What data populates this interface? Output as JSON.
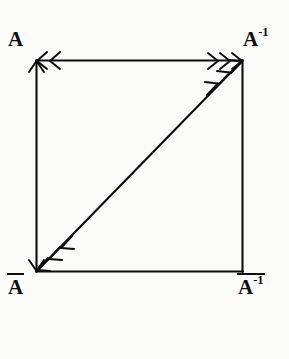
{
  "figure": {
    "background_color": "#fbfbf9",
    "ink_color": "#0d0d0d"
  },
  "vertices": {
    "top_left": {
      "base": "A",
      "overline": false,
      "superscript": ""
    },
    "top_right": {
      "base": "A",
      "overline": false,
      "superscript": "-1"
    },
    "bottom_left": {
      "base": "A",
      "overline": true,
      "superscript": ""
    },
    "bottom_right": {
      "base": "A",
      "overline": true,
      "superscript": "-1"
    }
  },
  "edges": {
    "top": {
      "name": "top-edge",
      "arrow_left_count": 2,
      "arrow_right_count": 3,
      "double_headed": true
    },
    "left": {
      "name": "left-edge",
      "arrow_up_count": 1,
      "arrow_down_count": 1,
      "double_headed": true
    },
    "right": {
      "name": "right-edge",
      "arrow_up_count": 0,
      "arrow_down_count": 0,
      "double_headed": false
    },
    "bottom": {
      "name": "bottom-edge",
      "arrow_left_count": 0,
      "arrow_right_count": 0,
      "double_headed": false
    },
    "diagonal": {
      "name": "diagonal-edge",
      "arrow_up_count": 3,
      "arrow_down_count": 3,
      "double_headed": true
    }
  },
  "geometry": {
    "left_x": 36,
    "right_x": 243,
    "top_y": 60,
    "bottom_y": 272,
    "stroke_width": 2.1
  }
}
